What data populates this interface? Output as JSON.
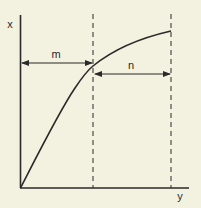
{
  "diagram": {
    "axes": {
      "vertical_label": "x",
      "horizontal_label": "y"
    },
    "annotations": {
      "m_label": "m",
      "n_label": "n"
    },
    "colors": {
      "background": "#f3f1df",
      "ink": "#2a2a2a"
    }
  }
}
